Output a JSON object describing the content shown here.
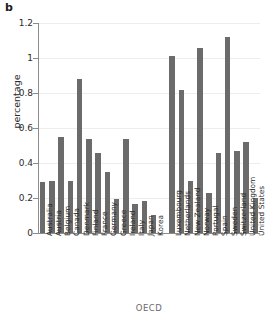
{
  "panel": {
    "label": "b"
  },
  "chart_data": {
    "type": "bar",
    "title": "",
    "xlabel": "OECD",
    "ylabel": "percentage",
    "ylim": [
      0,
      1.2
    ],
    "yticks": [
      0,
      0.2,
      0.4,
      0.6,
      0.8,
      1,
      1.2
    ],
    "ytick_labels": [
      "0",
      "0.2",
      "0.4",
      "0.6",
      "0.8",
      "1",
      "1.2"
    ],
    "grid": true,
    "legend": "none",
    "bar_color": "#6b6b6b",
    "categories": [
      "Australia",
      "Austria",
      "Belgium",
      "Canada",
      "Denmark",
      "Finland",
      "France",
      "Germany",
      "Greece",
      "Ireland",
      "Italy",
      "Japan",
      "Korea",
      "Luxembourg",
      "Netherlands",
      "New Zealand",
      "Norway",
      "Portugal",
      "Spain",
      "Sweden",
      "Switzerland",
      "United Kingdom",
      "United States"
    ],
    "values": [
      0.29,
      0.3,
      0.55,
      0.3,
      0.88,
      0.54,
      0.46,
      0.35,
      0.195,
      0.54,
      0.165,
      0.185,
      0.105,
      1.01,
      0.82,
      0.295,
      1.06,
      0.23,
      0.455,
      1.12,
      0.47,
      0.52,
      0.2
    ]
  }
}
